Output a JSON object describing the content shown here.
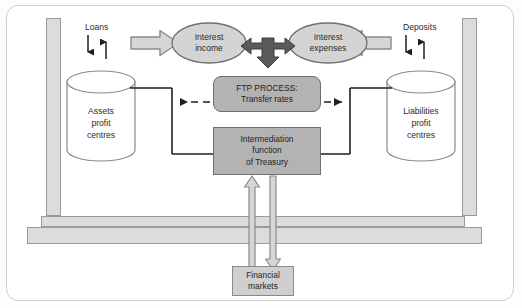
{
  "diagram": {
    "labels": {
      "loans": "Loans",
      "deposits": "Deposits"
    },
    "nodes": {
      "assets_cylinder": "Assets\nprofit\ncentres",
      "assets_cylinder_lines": [
        "Assets",
        "profit",
        "centres"
      ],
      "liabilities_cylinder_lines": [
        "Liabilities",
        "profit",
        "centres"
      ],
      "interest_income_lines": [
        "Interest",
        "income"
      ],
      "interest_expenses_lines": [
        "Interest",
        "expenses"
      ],
      "ftp_process_lines": [
        "FTP PROCESS:",
        "Transfer rates"
      ],
      "intermediation_lines": [
        "Intermediation",
        "function",
        "of Treasury"
      ],
      "financial_markets_lines": [
        "Financial",
        "markets"
      ]
    },
    "colors": {
      "frame_border": "#cfcfcf",
      "pillar_fill": "#dcdcdc",
      "pillar_stroke": "#9a9a9a",
      "bar_fill": "#dcdcdc",
      "grey_box_fill": "#b3b3b3",
      "grey_box_stroke": "#6f6f6f",
      "light_box_fill": "#cfcfcf",
      "ellipse_fill": "#d4d4d4",
      "ellipse_stroke": "#6f6f6f",
      "block_arrow_fill": "#d6d6d6",
      "block_arrow_stroke": "#8a8a8a",
      "dark_arrow_fill": "#5a5a5a",
      "cylinder_fill": "#ffffff",
      "cylinder_stroke": "#8a8a8a",
      "connector_stroke": "#1f1f1f",
      "text": "#2b2b2b"
    }
  }
}
